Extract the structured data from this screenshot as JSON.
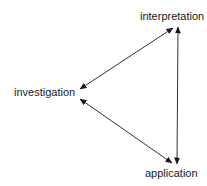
{
  "diagram": {
    "type": "cycle-triangle",
    "nodes": [
      {
        "id": "interpretation",
        "label": "interpretation"
      },
      {
        "id": "investigation",
        "label": "investigation"
      },
      {
        "id": "application",
        "label": "application"
      }
    ],
    "edges": [
      {
        "from": "investigation",
        "to": "interpretation",
        "direction": "both"
      },
      {
        "from": "investigation",
        "to": "application",
        "direction": "both"
      },
      {
        "from": "interpretation",
        "to": "application",
        "direction": "both"
      }
    ],
    "line_color": "#1a1a1a",
    "text_color": "#1a1a1a"
  }
}
